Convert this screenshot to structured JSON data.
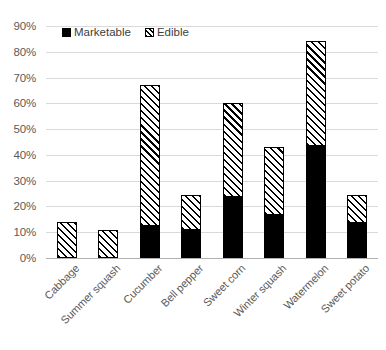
{
  "chart_data": {
    "type": "bar",
    "stacked": true,
    "title": "",
    "subtitle": "",
    "xlabel": "",
    "ylabel": "",
    "ylim": [
      0,
      90
    ],
    "ytick_step": 10,
    "ytick_labels": [
      "0%",
      "10%",
      "20%",
      "30%",
      "40%",
      "50%",
      "60%",
      "70%",
      "80%",
      "90%"
    ],
    "ytick_values": [
      0,
      10,
      20,
      30,
      40,
      50,
      60,
      70,
      80,
      90
    ],
    "grid": true,
    "grid_axis": "y",
    "legend_position": "top-left-inside",
    "categories": [
      "Cabbage",
      "Summer squash",
      "Cucumber",
      "Bell pepper",
      "Sweet corn",
      "Winter squash",
      "Watermelon",
      "Sweet potato"
    ],
    "series": [
      {
        "name": "Marketable",
        "fill": "solid-black",
        "color": "#000000",
        "values": [
          0,
          0,
          12.5,
          11,
          23.5,
          16.5,
          43.5,
          13.5
        ]
      },
      {
        "name": "Edible",
        "fill": "diagonal-hatch",
        "color": "#000000",
        "values": [
          14,
          11,
          54.5,
          13.5,
          36.5,
          26.5,
          40.5,
          11
        ]
      }
    ],
    "totals": [
      14,
      11,
      67,
      24.5,
      60,
      43,
      84,
      24.5
    ]
  },
  "legend": {
    "items": [
      {
        "label": "Marketable",
        "swatch": "solid-square-icon"
      },
      {
        "label": "Edible",
        "swatch": "hatched-square-icon"
      }
    ]
  },
  "colors": {
    "series_stroke": "#000000",
    "marketable_fill": "#000000",
    "edible_fill": "#ffffff",
    "gridline": "#d9d9d9",
    "axis_line": "#b0b0b0",
    "tick_text": "#5a5a5a",
    "background": "#ffffff"
  }
}
